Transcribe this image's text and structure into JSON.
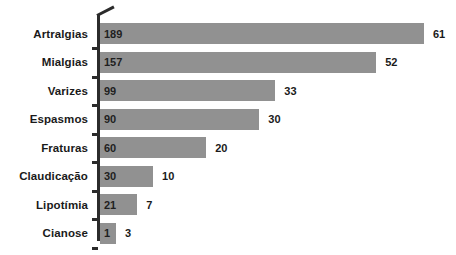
{
  "chart_data": {
    "type": "bar",
    "orientation": "horizontal",
    "title": "",
    "subtitle": "",
    "xlabel": "",
    "ylabel": "",
    "grid": false,
    "legend": null,
    "axis_break": true,
    "xlim": [
      0,
      68
    ],
    "categories": [
      "Artralgias",
      "Mialgias",
      "Varizes",
      "Espasmos",
      "Fraturas",
      "Claudicação",
      "Lipotímia",
      "Cianose"
    ],
    "series": [
      {
        "name": "Percentual",
        "values": [
          61,
          52,
          33,
          30,
          20,
          10,
          7,
          3
        ],
        "label_position": "outside-end"
      },
      {
        "name": "Casos",
        "values": [
          189,
          157,
          99,
          90,
          60,
          30,
          21,
          1
        ],
        "label_position": "inside-start"
      }
    ],
    "colors": {
      "bar": "#919191",
      "axis": "#2b2b2b",
      "label_text": "#1a1a1a",
      "background": "#ffffff"
    },
    "rows": [
      {
        "category": "Artralgias",
        "count": "189",
        "percent": "61"
      },
      {
        "category": "Mialgias",
        "count": "157",
        "percent": "52"
      },
      {
        "category": "Varizes",
        "count": "99",
        "percent": "33"
      },
      {
        "category": "Espasmos",
        "count": "90",
        "percent": "30"
      },
      {
        "category": "Fraturas",
        "count": "60",
        "percent": "20"
      },
      {
        "category": "Claudicação",
        "count": "30",
        "percent": "10"
      },
      {
        "category": "Lipotímia",
        "count": "21",
        "percent": "7"
      },
      {
        "category": "Cianose",
        "count": "1",
        "percent": "3"
      }
    ]
  }
}
